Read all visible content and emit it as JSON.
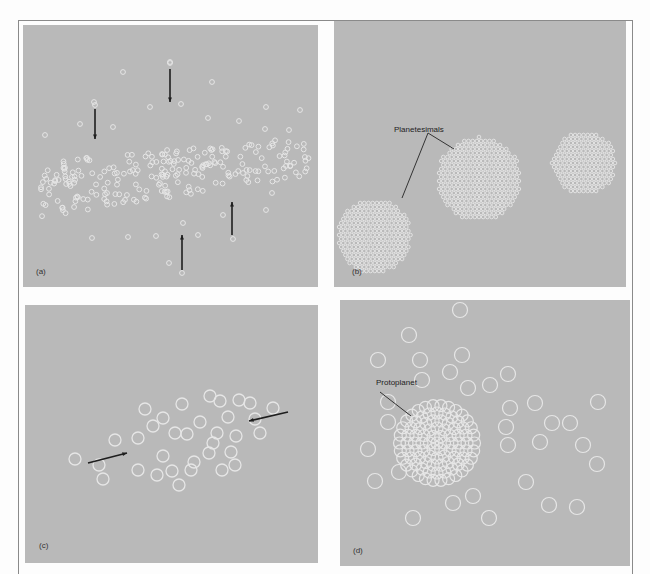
{
  "figure": {
    "background": "#b9b9b9",
    "particle_color": "#e6e6e6",
    "arrow_color": "#1e1e1e",
    "panels": [
      {
        "id": "a",
        "label": "(a)",
        "description": "Dust particles settling toward the disk midplane"
      },
      {
        "id": "b",
        "label": "(b)",
        "callout": "Planetesimals",
        "description": "Clumps of particles forming planetesimals"
      },
      {
        "id": "c",
        "label": "(c)",
        "description": "Planetesimals converging"
      },
      {
        "id": "d",
        "label": "(d)",
        "callout": "Protoplanet",
        "description": "Planetesimals accreting into a protoplanet"
      }
    ]
  }
}
